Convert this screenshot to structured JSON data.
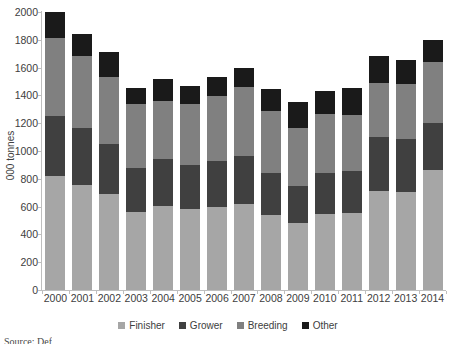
{
  "chart_data": {
    "type": "bar",
    "subtype": "stacked-bar",
    "title": "",
    "xlabel": "",
    "ylabel": "000 tonnes",
    "ylim": [
      0,
      2000
    ],
    "ytick_step": 200,
    "yticks": [
      0,
      200,
      400,
      600,
      800,
      1000,
      1200,
      1400,
      1600,
      1800,
      2000
    ],
    "ytick_labels": [
      "0",
      "200",
      "400",
      "600",
      "800",
      "1000",
      "1200",
      "1400",
      "1600",
      "1800",
      "2000"
    ],
    "grid": false,
    "legend_position": "bottom",
    "categories": [
      "2000",
      "2001",
      "2002",
      "2003",
      "2004",
      "2005",
      "2006",
      "2007",
      "2008",
      "2009",
      "2010",
      "2011",
      "2012",
      "2013",
      "2014"
    ],
    "series": [
      {
        "name": "Finisher",
        "color": "#a6a6a6",
        "values": [
          820,
          755,
          690,
          560,
          605,
          580,
          595,
          620,
          540,
          480,
          545,
          555,
          710,
          705,
          865
        ]
      },
      {
        "name": "Grower",
        "color": "#404040",
        "values": [
          430,
          410,
          360,
          320,
          335,
          320,
          330,
          345,
          300,
          265,
          300,
          300,
          390,
          385,
          335
        ]
      },
      {
        "name": "Breeding",
        "color": "#808080",
        "values": [
          560,
          520,
          485,
          460,
          420,
          440,
          470,
          495,
          450,
          420,
          420,
          405,
          390,
          390,
          440
        ]
      },
      {
        "name": "Other",
        "color": "#1a1a1a",
        "values": [
          190,
          160,
          175,
          115,
          155,
          130,
          140,
          140,
          155,
          190,
          165,
          195,
          190,
          175,
          160
        ]
      }
    ],
    "totals": [
      2000,
      1845,
      1710,
      1455,
      1515,
      1470,
      1535,
      1600,
      1445,
      1355,
      1430,
      1455,
      1680,
      1655,
      1800
    ],
    "annotations": []
  },
  "legend": {
    "items": [
      {
        "label": "Finisher",
        "color": "#a6a6a6"
      },
      {
        "label": "Grower",
        "color": "#404040"
      },
      {
        "label": "Breeding",
        "color": "#808080"
      },
      {
        "label": "Other",
        "color": "#1a1a1a"
      }
    ]
  },
  "caption": {
    "text": "Source: Def"
  },
  "colors": {
    "axis": "#bfbfbf",
    "tick_text": "#404040",
    "background": "#ffffff"
  }
}
